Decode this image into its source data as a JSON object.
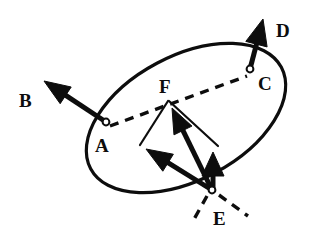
{
  "figure": {
    "type": "vector-diagram",
    "background_color": "#ffffff",
    "ink_color": "#0d0d0d",
    "stroke_width_ellipse": 3.2,
    "stroke_width_arrow": 5.0,
    "stroke_width_thin": 2.2,
    "dash_pattern": "9 7"
  },
  "ellipse": {
    "name": "tilted-ellipse",
    "center_x": 186,
    "center_y": 118,
    "radius_x": 108,
    "radius_y": 62,
    "rotation_deg": -28
  },
  "points": [
    {
      "id": "A",
      "label": "A",
      "x": 106,
      "y": 122,
      "marker": "open-circle",
      "radius": 3.4,
      "label_x": 95,
      "label_y": 136
    },
    {
      "id": "C",
      "label": "C",
      "x": 250,
      "y": 69,
      "marker": "open-circle",
      "radius": 3.4,
      "label_x": 258,
      "label_y": 74
    },
    {
      "id": "E",
      "label": "E",
      "x": 212,
      "y": 190,
      "marker": "open-circle",
      "radius": 3.4,
      "label_x": 213,
      "label_y": 209
    },
    {
      "id": "F",
      "label": "F",
      "x": 168,
      "y": 100,
      "marker": "none",
      "radius": 0,
      "label_x": 159,
      "label_y": 77
    },
    {
      "id": "B",
      "label": "B",
      "x": 45,
      "y": 82,
      "marker": "none",
      "radius": 0,
      "label_x": 19,
      "label_y": 91
    },
    {
      "id": "D",
      "label": "D",
      "x": 263,
      "y": 20,
      "marker": "none",
      "radius": 0,
      "label_x": 276,
      "label_y": 21
    }
  ],
  "arrows": [
    {
      "id": "arrow-B",
      "label": "B",
      "from": {
        "x": 106,
        "y": 122
      },
      "to": {
        "x": 44,
        "y": 81
      },
      "style": "solid-thick",
      "head": "filled-triangle",
      "head_len": 26,
      "head_half_width": 10
    },
    {
      "id": "arrow-D",
      "label": "D",
      "from": {
        "x": 250,
        "y": 69
      },
      "to": {
        "x": 263,
        "y": 19
      },
      "style": "solid-thick",
      "head": "filled-triangle",
      "head_len": 26,
      "head_half_width": 11
    },
    {
      "id": "arrow-E-to-F",
      "label": "",
      "from": {
        "x": 212,
        "y": 190
      },
      "to": {
        "x": 172,
        "y": 108
      },
      "style": "solid-thick",
      "head": "filled-triangle",
      "head_len": 25,
      "head_half_width": 10
    },
    {
      "id": "arrow-E-to-A-line",
      "label": "",
      "from": {
        "x": 212,
        "y": 190
      },
      "to": {
        "x": 146,
        "y": 149
      },
      "style": "solid-thick",
      "head": "filled-triangle",
      "head_len": 26,
      "head_half_width": 10
    },
    {
      "id": "arrow-E-to-right",
      "label": "",
      "from": {
        "x": 213,
        "y": 192
      },
      "to": {
        "x": 213,
        "y": 152
      },
      "style": "solid-thick",
      "head": "filled-triangle",
      "head_len": 24,
      "head_half_width": 11
    }
  ],
  "dashed_segments": [
    {
      "id": "dash-A-to-C",
      "from": {
        "x": 110,
        "y": 126
      },
      "to": {
        "x": 247,
        "y": 76
      },
      "note": "chord through ellipse from A to C"
    },
    {
      "id": "dash-E-lower-left",
      "from": {
        "x": 207,
        "y": 196
      },
      "to": {
        "x": 193,
        "y": 221
      },
      "note": "ray below E to the left"
    },
    {
      "id": "dash-E-lower-right",
      "from": {
        "x": 219,
        "y": 195
      },
      "to": {
        "x": 248,
        "y": 216
      },
      "note": "ray below E to the right"
    }
  ],
  "thin_segments": [
    {
      "id": "thin-F-to-west",
      "from": {
        "x": 168,
        "y": 101
      },
      "to": {
        "x": 140,
        "y": 145
      }
    },
    {
      "id": "thin-F-to-east",
      "from": {
        "x": 169,
        "y": 101
      },
      "to": {
        "x": 218,
        "y": 146
      }
    }
  ],
  "labels": {
    "A": "A",
    "B": "B",
    "C": "C",
    "D": "D",
    "E": "E",
    "F": "F"
  }
}
